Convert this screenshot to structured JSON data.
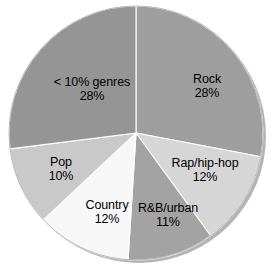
{
  "chart_data": {
    "type": "pie",
    "title": "",
    "subtitle": "",
    "xlabel": "",
    "ylabel": "",
    "legend_position": "none",
    "grid": false,
    "value_unit": "%",
    "categories": [
      "Rock",
      "Rap/hip-hop",
      "R&B/urban",
      "Country",
      "Pop",
      "< 10% genres"
    ],
    "values": [
      28,
      12,
      11,
      12,
      10,
      28
    ],
    "slices": [
      {
        "label": "Rock",
        "value": 28,
        "value_text": "28%",
        "color": "#9e9e9e",
        "start_angle": 0,
        "end_angle": 100.8,
        "label_x": 207,
        "label_y": 86
      },
      {
        "label": "Rap/hip-hop",
        "value": 12,
        "value_text": "12%",
        "color": "#d6d6d6",
        "start_angle": 100.8,
        "end_angle": 144.0,
        "label_x": 205,
        "label_y": 170
      },
      {
        "label": "R&B/urban",
        "value": 11,
        "value_text": "11%",
        "color": "#a3a3a3",
        "start_angle": 144.0,
        "end_angle": 183.6,
        "label_x": 168,
        "label_y": 215
      },
      {
        "label": "Country",
        "value": 12,
        "value_text": "12%",
        "color": "#f7f7f7",
        "start_angle": 183.6,
        "end_angle": 226.8,
        "label_x": 107,
        "label_y": 212
      },
      {
        "label": "Pop",
        "value": 10,
        "value_text": "10%",
        "color": "#c9c9c9",
        "start_angle": 226.8,
        "end_angle": 262.8,
        "label_x": 61,
        "label_y": 169
      },
      {
        "label": "< 10% genres",
        "value": 28,
        "value_text": "28%",
        "color": "#959595",
        "start_angle": 262.8,
        "end_angle": 360,
        "label_x": 92,
        "label_y": 89
      }
    ],
    "geometry": {
      "center_x": 136,
      "center_y": 133,
      "radius": 127,
      "shadow_color": "#b4b4b4",
      "separator_color": "#ffffff"
    }
  }
}
